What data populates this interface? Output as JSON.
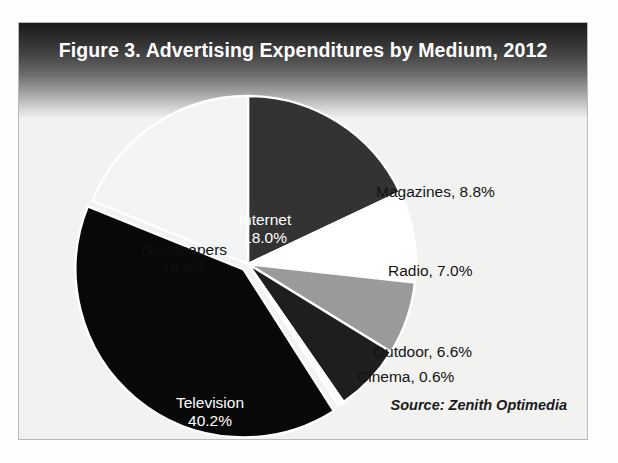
{
  "figure": {
    "title": "Figure 3. Advertising Expenditures by Medium, 2012",
    "source": "Source: Zenith Optimedia"
  },
  "labels": {
    "internet_name": "Internet",
    "internet_value": "18.0%",
    "newspapers_name": "Newspapers",
    "newspapers_value": "18.9%",
    "television_name": "Television",
    "television_value": "40.2%",
    "magazines": "Magazines, 8.8%",
    "radio": "Radio, 7.0%",
    "outdoor": "Outdoor, 6.6%",
    "cinema": "Cinema, 0.6%"
  },
  "chart_data": {
    "type": "pie",
    "title": "Figure 3. Advertising Expenditures by Medium, 2012",
    "source": "Source: Zenith Optimedia",
    "unit": "percent",
    "categories": [
      "Internet",
      "Magazines",
      "Radio",
      "Outdoor",
      "Cinema",
      "Television",
      "Newspapers"
    ],
    "values": [
      18.0,
      8.8,
      7.0,
      6.6,
      0.6,
      40.2,
      18.9
    ],
    "total": 100.1,
    "start_angle_deg": 0,
    "direction": "clockwise",
    "legend": "none",
    "grid": false,
    "slices": [
      {
        "label": "Internet",
        "value": 18.0,
        "display": "Internet 18.0%",
        "color": "#333333",
        "label_placement": "inside",
        "label_color": "#ffffff",
        "exploded": false
      },
      {
        "label": "Magazines",
        "value": 8.8,
        "display": "Magazines, 8.8%",
        "color": "#ffffff",
        "label_placement": "outside",
        "label_color": "#141414",
        "exploded": false
      },
      {
        "label": "Radio",
        "value": 7.0,
        "display": "Radio, 7.0%",
        "color": "#9a9a9a",
        "label_placement": "outside",
        "label_color": "#141414",
        "exploded": false
      },
      {
        "label": "Outdoor",
        "value": 6.6,
        "display": "Outdoor, 6.6%",
        "color": "#1e1e1e",
        "label_placement": "outside",
        "label_color": "#141414",
        "exploded": false
      },
      {
        "label": "Cinema",
        "value": 0.6,
        "display": "Cinema, 0.6%",
        "color": "#fbfbfb",
        "label_placement": "outside",
        "label_color": "#141414",
        "exploded": false
      },
      {
        "label": "Television",
        "value": 40.2,
        "display": "Television 40.2%",
        "color": "#080808",
        "label_placement": "inside",
        "label_color": "#ffffff",
        "exploded": true
      },
      {
        "label": "Newspapers",
        "value": 18.9,
        "display": "Newspapers 18.9%",
        "color": "#f4f4f4",
        "label_placement": "inside",
        "label_color": "#111111",
        "exploded": false
      }
    ]
  },
  "colors": {
    "frame_border": "#b9b9b9",
    "panel_background": "#f2f2f1",
    "header_dark": "#1b1b1b",
    "title_text": "#ffffff",
    "body_text": "#141414"
  }
}
